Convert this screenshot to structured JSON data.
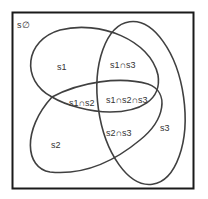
{
  "diagram": {
    "type": "venn",
    "universe_label": "s∅",
    "stroke_color": "#404040",
    "border_color": "#1a1a1a",
    "sets": [
      {
        "name": "s1",
        "label": "s1"
      },
      {
        "name": "s2",
        "label": "s2"
      },
      {
        "name": "s3",
        "label": "s3"
      }
    ],
    "regions": [
      {
        "id": "s1",
        "label": "s1"
      },
      {
        "id": "s2",
        "label": "s2"
      },
      {
        "id": "s3",
        "label": "s3"
      },
      {
        "id": "s1-s3",
        "label": "s1∩s3"
      },
      {
        "id": "s1-s2",
        "label": "s1∩s2"
      },
      {
        "id": "s1-s2-s3",
        "label": "s1∩s2∩s3"
      },
      {
        "id": "s2-s3",
        "label": "s2∩s3"
      }
    ]
  }
}
